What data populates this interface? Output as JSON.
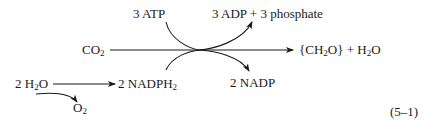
{
  "diagram": {
    "type": "reaction-scheme",
    "labels": {
      "atp": "3 ATP",
      "adp_phosphate": "3 ADP + 3 phosphate",
      "co2_main": "CO",
      "co2_sub": "2",
      "product_ch2o_open": "{CH",
      "product_ch2o_sub": "2",
      "product_ch2o_close": "O} + H",
      "product_h2o_sub": "2",
      "product_h2o_end": "O",
      "water_prefix": "2 H",
      "water_sub": "2",
      "water_suffix": "O",
      "nadph2_main": "2 NADPH",
      "nadph2_sub": "2",
      "nadp": "2 NADP",
      "o2_main": "O",
      "o2_sub": "2",
      "equation_number": "(5–1)"
    },
    "nodes": [
      "3 ATP",
      "3 ADP + 3 phosphate",
      "CO2",
      "{CH2O} + H2O",
      "2 H2O",
      "2 NADPH2",
      "2 NADP",
      "O2"
    ],
    "edges": [
      {
        "from": "CO2",
        "to": "{CH2O} + H2O",
        "style": "straight-arrow"
      },
      {
        "from": "3 ATP",
        "to": "3 ADP + 3 phosphate",
        "style": "curved-through-junction"
      },
      {
        "from": "2 NADPH2",
        "to": "2 NADP",
        "style": "curved-through-junction"
      },
      {
        "from": "2 H2O",
        "to": "2 NADPH2",
        "style": "straight-arrow"
      },
      {
        "from": "2 H2O",
        "to": "O2",
        "style": "curved-arrow"
      }
    ],
    "colors": {
      "ink": "#1a1a1a",
      "background": "#ffffff"
    }
  }
}
